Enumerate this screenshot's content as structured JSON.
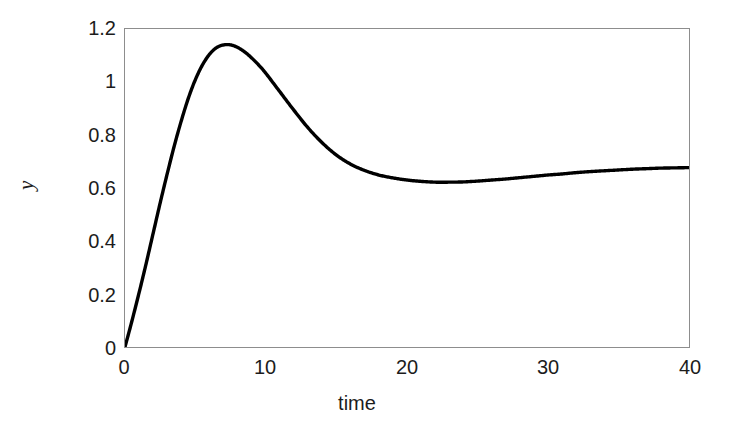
{
  "chart_data": {
    "type": "line",
    "title": "",
    "subtitle": "",
    "xlabel": "time",
    "ylabel": "y",
    "xlim": [
      0,
      40
    ],
    "ylim": [
      0,
      1.2
    ],
    "xticks": [
      0,
      10,
      20,
      30,
      40
    ],
    "xtick_labels": [
      "0",
      "10",
      "20",
      "30",
      "40"
    ],
    "yticks": [
      0,
      0.2,
      0.4,
      0.6,
      0.8,
      1,
      1.2
    ],
    "ytick_labels": [
      "0",
      "0.2",
      "0.4",
      "0.6",
      "0.8",
      "1",
      "1.2"
    ],
    "grid": false,
    "legend": false,
    "legend_position": "none",
    "line_color": "#000000",
    "line_width": 3,
    "frame_color": "#8d8d8d",
    "background": "#ffffff",
    "annotations": [],
    "series": [
      {
        "name": "y(t)",
        "x": [
          0,
          0.5,
          1,
          1.5,
          2,
          2.5,
          3,
          3.5,
          4,
          4.5,
          5,
          5.5,
          6,
          6.5,
          7,
          7.5,
          8,
          8.5,
          9,
          9.5,
          10,
          11,
          12,
          13,
          14,
          15,
          16,
          17,
          18,
          19,
          20,
          21,
          22,
          23,
          24,
          25,
          26,
          27,
          28,
          29,
          30,
          31,
          32,
          33,
          34,
          35,
          36,
          37,
          38,
          39,
          40
        ],
        "y": [
          0,
          0.1,
          0.205,
          0.315,
          0.43,
          0.545,
          0.655,
          0.76,
          0.855,
          0.94,
          1.01,
          1.065,
          1.105,
          1.13,
          1.14,
          1.14,
          1.13,
          1.113,
          1.09,
          1.063,
          1.032,
          0.962,
          0.892,
          0.826,
          0.77,
          0.724,
          0.69,
          0.666,
          0.649,
          0.638,
          0.63,
          0.625,
          0.622,
          0.622,
          0.623,
          0.626,
          0.63,
          0.634,
          0.639,
          0.644,
          0.649,
          0.653,
          0.658,
          0.662,
          0.665,
          0.668,
          0.671,
          0.673,
          0.675,
          0.676,
          0.677
        ]
      }
    ],
    "features": {
      "peak_value": 1.14,
      "peak_time": 7.0,
      "min_after_peak_value": 0.622,
      "min_after_peak_time": 22.5,
      "final_value": 0.677,
      "initial_value": 0.0
    }
  },
  "axes": {
    "x_title": "time",
    "y_title": "y"
  }
}
